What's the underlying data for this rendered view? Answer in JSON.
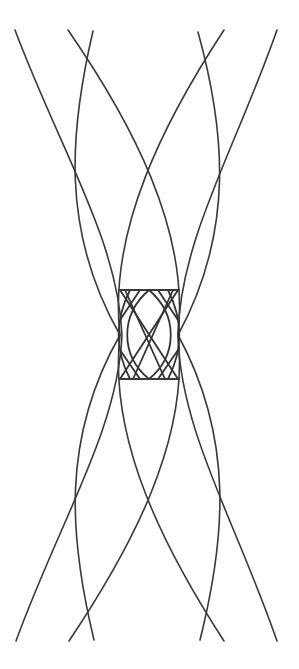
{
  "figure": {
    "width": 299,
    "height": 669,
    "background": "#ffffff",
    "stroke_color": "#3a3a3a"
  },
  "curves": [
    {
      "id": "c1",
      "d": "M15,30 C60,150 118,240 122,335 C118,430 60,520 16,641"
    },
    {
      "id": "c2",
      "d": "M68,30 C130,120 190,230 178,335 C190,440 130,550 69,641"
    },
    {
      "id": "c3",
      "d": "M93,31 C70,130 60,230 120,335 C60,440 70,540 94,640"
    },
    {
      "id": "c4",
      "d": "M198,32 C225,130 235,230 178,335 C235,440 225,540 200,640"
    },
    {
      "id": "c5",
      "d": "M224,30 C165,120 108,230 120,335 C108,440 165,550 224,641"
    },
    {
      "id": "c6",
      "d": "M277,30 C235,150 180,240 178,335 C180,430 235,520 277,641"
    }
  ],
  "bars": [
    {
      "id": "top-bar",
      "x1": 118,
      "y1": 290,
      "x2": 180,
      "y2": 290
    },
    {
      "id": "bottom-bar",
      "x1": 118,
      "y1": 379,
      "x2": 180,
      "y2": 379
    }
  ],
  "lattice": [
    {
      "id": "l1",
      "d": "M120,290 L178,379"
    },
    {
      "id": "l2",
      "d": "M178,290 L120,379"
    },
    {
      "id": "l3",
      "d": "M130,290 C115,320 115,350 130,379"
    },
    {
      "id": "l4",
      "d": "M168,290 C183,320 183,350 168,379"
    },
    {
      "id": "l5",
      "d": "M140,290 L120,320 M158,290 L178,320"
    },
    {
      "id": "l6",
      "d": "M140,379 L120,350 M158,379 L178,350"
    },
    {
      "id": "l7",
      "d": "M125,290 L165,379"
    },
    {
      "id": "l8",
      "d": "M173,290 L133,379"
    },
    {
      "id": "l9",
      "d": "M149,290 C120,315 120,355 149,379"
    },
    {
      "id": "l10",
      "d": "M149,290 C178,315 178,355 149,379"
    }
  ]
}
